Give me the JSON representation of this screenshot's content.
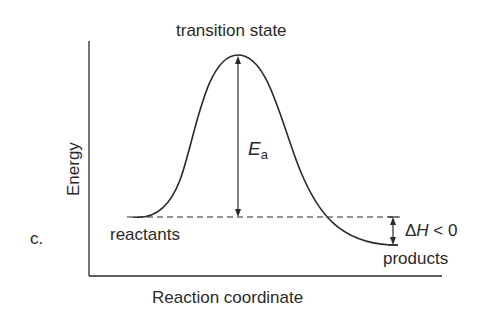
{
  "diagram": {
    "panel_label": "c.",
    "title_peak": "transition state",
    "y_axis_label": "Energy",
    "x_axis_label": "Reaction coordinate",
    "reactants_label": "reactants",
    "products_label": "products",
    "activation_energy": {
      "symbol": "E",
      "subscript": "a"
    },
    "enthalpy_change": {
      "delta": "Δ",
      "symbol": "H",
      "relation": " < 0"
    },
    "colors": {
      "line": "#2a2a2a",
      "background": "#ffffff"
    }
  }
}
